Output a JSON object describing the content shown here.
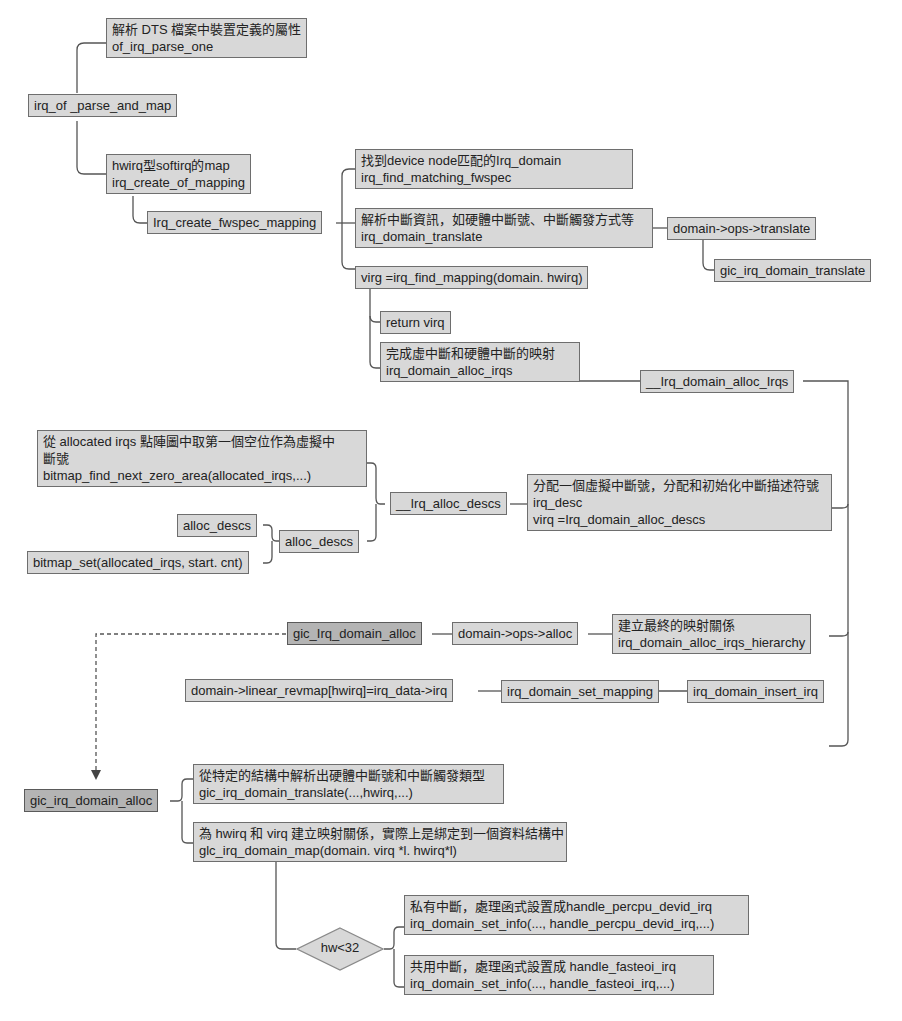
{
  "diagram": {
    "nodes": {
      "dts_parse": {
        "lines": [
          "解析 DTS 檔案中裝置定義的屬性",
          "of_irq_parse_one"
        ]
      },
      "irq_of_parse_and_map": {
        "lines": [
          "irq_of _parse_and_map"
        ]
      },
      "irq_create_of_mapping": {
        "lines": [
          "hwirq型softirq的map",
          "irq_create_of_mapping"
        ]
      },
      "irq_create_fwspec_mapping": {
        "lines": [
          "Irq_create_fwspec_mapping"
        ]
      },
      "irq_find_matching_fwspec": {
        "lines": [
          "找到device node匹配的Irq_domain",
          "irq_find_matching_fwspec"
        ]
      },
      "irq_domain_translate": {
        "lines": [
          "解析中斷資訊，如硬體中斷號、中斷觸發方式等",
          "irq_domain_translate"
        ]
      },
      "ops_translate": {
        "lines": [
          "domain->ops->translate"
        ]
      },
      "gic_irq_domain_translate_top": {
        "lines": [
          "gic_irq_domain_translate"
        ]
      },
      "irq_find_mapping": {
        "lines": [
          "virg =irq_find_mapping(domain. hwirq)"
        ]
      },
      "return_virq": {
        "lines": [
          "return virq"
        ]
      },
      "irq_domain_alloc_irqs": {
        "lines": [
          "完成虛中斷和硬體中斷的映射",
          "irq_domain_alloc_irqs"
        ]
      },
      "__irq_domain_alloc_irqs": {
        "lines": [
          "__Irq_domain_alloc_Irqs"
        ]
      },
      "bitmap_find": {
        "lines": [
          "從 allocated irqs 點陣圖中取第一個空位作為虛擬中",
          "斷號",
          "bitmap_find_next_zero_area(allocated_irqs,...)"
        ]
      },
      "alloc_descs_leaf": {
        "lines": [
          "alloc_descs"
        ]
      },
      "bitmap_set": {
        "lines": [
          "bitmap_set(allocated_irqs, start. cnt)"
        ]
      },
      "alloc_descs": {
        "lines": [
          "alloc_descs"
        ]
      },
      "__irq_alloc_descs": {
        "lines": [
          "__Irq_alloc_descs"
        ]
      },
      "irq_domain_alloc_descs": {
        "lines": [
          "分配一個虛擬中斷號，分配和初始化中斷描述符號",
          "irq_desc",
          "virq =Irq_domain_alloc_descs"
        ]
      },
      "gic_irq_domain_alloc_ref": {
        "lines": [
          "gic_Irq_domain_alloc"
        ]
      },
      "ops_alloc": {
        "lines": [
          "domain->ops->alloc"
        ]
      },
      "alloc_irqs_hierarchy": {
        "lines": [
          "建立最終的映射關係",
          "irq_domain_alloc_irqs_hierarchy"
        ]
      },
      "linear_revmap": {
        "lines": [
          "domain->linear_revmap[hwirq]=irq_data->irq"
        ]
      },
      "irq_domain_set_mapping": {
        "lines": [
          "irq_domain_set_mapping"
        ]
      },
      "irq_domain_insert_irq": {
        "lines": [
          "irq_domain_insert_irq"
        ]
      },
      "gic_irq_domain_alloc": {
        "lines": [
          "gic_irq_domain_alloc"
        ]
      },
      "gic_translate": {
        "lines": [
          "從特定的結構中解析出硬體中斷號和中斷觸發類型",
          "gic_irq_domain_translate(...,hwirq,...)"
        ]
      },
      "gic_map": {
        "lines": [
          "為 hwirq 和 virq 建立映射關係，實際上是綁定到一個資料結構中",
          "glc_irq_domain_map(domain. virq *l. hwirq*l)"
        ]
      },
      "percpu": {
        "lines": [
          "私有中斷，處理函式設置成handle_percpu_devid_irq",
          "irq_domain_set_info(..., handle_percpu_devid_irq,...)"
        ]
      },
      "fasteoi": {
        "lines": [
          "共用中斷，處理函式設置成 handle_fasteoi_irq",
          "irq_domain_set_info(..., handle_fasteoi_irq,...)"
        ]
      }
    },
    "decision": {
      "label": "hw<32"
    },
    "colors": {
      "box_fill": "#d8d8d8",
      "box_fill_dark": "#b4b4b4",
      "border": "#6e6e6e",
      "wire": "#555555"
    }
  }
}
